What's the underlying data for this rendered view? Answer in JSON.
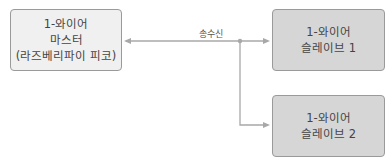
{
  "master": {
    "lines": [
      "1-와이어",
      "마스터",
      "(라즈베리파이 피코)"
    ]
  },
  "slave1": {
    "lines": [
      "1-와이어",
      "슬레이브 1"
    ]
  },
  "slave2": {
    "lines": [
      "1-와이어",
      "슬레이브 2"
    ]
  },
  "connection_label": "송수신",
  "colors": {
    "master_fill": "#f0f0f0",
    "slave_fill": "#d6d6d6",
    "line": "#a8a8a8"
  }
}
